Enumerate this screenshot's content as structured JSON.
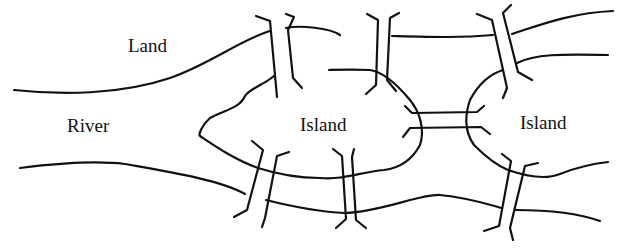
{
  "diagram": {
    "colors": {
      "ink": "#111111",
      "background": "#ffffff"
    },
    "labels": [
      {
        "id": "land",
        "text": "Land",
        "x": 128,
        "y": 36
      },
      {
        "id": "river",
        "text": "River",
        "x": 67,
        "y": 116
      },
      {
        "id": "island-left",
        "text": "Island",
        "x": 300,
        "y": 115
      },
      {
        "id": "island-right",
        "text": "Island",
        "x": 520,
        "y": 113
      }
    ],
    "shorelines": [
      {
        "id": "north-bank-left",
        "d": "M14,90 C60,95 120,95 170,78 C210,64 240,40 270,31"
      },
      {
        "id": "north-bank-mid",
        "d": "M286,28 C300,25 330,28 340,35"
      },
      {
        "id": "north-bank-right-upper",
        "d": "M512,34 C540,25 570,13 613,11"
      },
      {
        "id": "north-bank-right-lower",
        "d": "M517,63 C535,54 560,54 608,55"
      },
      {
        "id": "north-channel-top",
        "d": "M392,36 C430,37 460,38 493,35"
      },
      {
        "id": "left-island-shore",
        "d": "M274,76 C262,86 250,88 245,96 C240,108 225,110 210,118 C202,125 198,135 200,136 C215,146 235,160 258,168 C280,175 300,178 320,178 C345,180 360,172 384,170 C400,168 412,160 420,145 C425,130 420,112 410,100 C400,88 385,72 370,70 C350,69 330,70 329,70"
      },
      {
        "id": "right-island-shore",
        "d": "M503,70 C490,74 478,85 470,100 C464,118 466,134 474,145 C485,156 498,166 508,170 C525,176 545,180 560,174 C575,168 590,164 608,162"
      },
      {
        "id": "south-bank-left",
        "d": "M20,168 C60,163 100,161 125,164 C170,172 220,180 245,194"
      },
      {
        "id": "south-bank-mid",
        "d": "M266,200 C290,206 320,212 345,213 C380,212 420,194 440,195 C470,198 490,205 502,208"
      },
      {
        "id": "south-bank-right",
        "d": "M515,210 C545,210 575,212 600,221"
      }
    ],
    "bridges": [
      {
        "id": "bridge-north-left",
        "d": "M256,16 L270,21 L277,97 M286,14 L294,17 L288,30 L293,78 L302,88"
      },
      {
        "id": "bridge-north-mid",
        "d": "M367,14 L378,20 L376,85 L366,94 M399,13 L390,18 L387,80 L396,91"
      },
      {
        "id": "bridge-north-right",
        "d": "M477,14 L492,20 L507,88 L503,98 M511,5 L503,13 L518,72 L532,80"
      },
      {
        "id": "bridge-center-top",
        "d": "M405,106 L412,113 L477,112 L484,106"
      },
      {
        "id": "bridge-center-bottom",
        "d": "M403,137 L410,128 L481,127 L490,134"
      },
      {
        "id": "bridge-south-left",
        "d": "M252,141 L263,150 L247,210 L234,217 M289,152 L277,156 L265,218 L262,227"
      },
      {
        "id": "bridge-south-mid",
        "d": "M333,149 L342,156 L346,219 L336,228 M354,149 L352,157 L356,220 L366,228"
      },
      {
        "id": "bridge-south-right",
        "d": "M502,154 L511,161 L499,226 L484,231 M538,163 L525,166 L510,228 L513,240"
      }
    ]
  }
}
